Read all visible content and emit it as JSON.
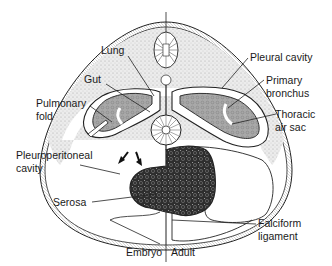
{
  "figure": {
    "colors": {
      "stipple": "#d9d9d9",
      "lung_fill": "#a9a9a9",
      "liver_fill": "#3a3a3a",
      "line": "#222222",
      "background": "#ffffff"
    }
  },
  "labels": {
    "lung": "Lung",
    "gut": "Gut",
    "pulmonary_fold_1": "Pulmonary",
    "pulmonary_fold_2": "fold",
    "pleuroperitoneal_1": "Pleuroperitoneal",
    "pleuroperitoneal_2": "cavity",
    "serosa": "Serosa",
    "pleural_cavity": "Pleural cavity",
    "primary_bronchus_1": "Primary",
    "primary_bronchus_2": "bronchus",
    "thoracic_air_sac_1": "Thoracic",
    "thoracic_air_sac_2": "air sac",
    "falciform_1": "Falciform",
    "falciform_2": "ligament",
    "embryo": "Embryo",
    "adult": "Adult"
  }
}
